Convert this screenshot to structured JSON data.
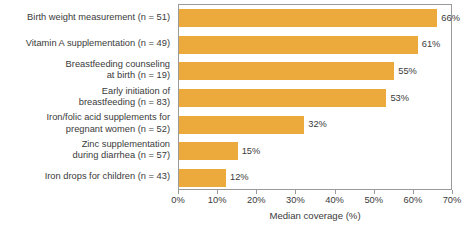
{
  "chart_data": {
    "type": "bar",
    "orientation": "horizontal",
    "title": "",
    "subtitle": "",
    "xlabel": "Median coverage (%)",
    "ylabel": "",
    "xlim": [
      0,
      70
    ],
    "xticks": [
      "0%",
      "10%",
      "20%",
      "30%",
      "40%",
      "50%",
      "60%",
      "70%"
    ],
    "xtick_values": [
      0,
      10,
      20,
      30,
      40,
      50,
      60,
      70
    ],
    "grid": false,
    "legend": false,
    "bar_color": "#eca93c",
    "categories": [
      "Birth weight measurement (n = 51)",
      "Vitamin A supplementation (n = 49)",
      "Breastfeeding counseling\nat birth (n = 19)",
      "Early initiation of\nbreastfeeding (n = 83)",
      "Iron/folic acid supplements for\npregnant women (n = 52)",
      "Zinc supplementation\nduring diarrhea (n = 57)",
      "Iron drops for children (n = 43)"
    ],
    "values": [
      66,
      61,
      55,
      53,
      32,
      15,
      12
    ],
    "value_labels": [
      "66%",
      "61%",
      "55%",
      "53%",
      "32%",
      "15%",
      "12%"
    ]
  }
}
